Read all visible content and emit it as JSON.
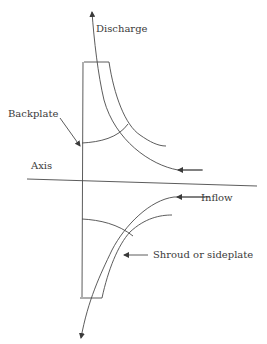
{
  "diagram": {
    "labels": {
      "discharge": "Discharge",
      "backplate": "Backplate",
      "axis": "Axis",
      "inflow": "Inflow",
      "shroud": "Shroud or sideplate"
    },
    "colors": {
      "line": "#4a4a4a",
      "text": "#3a3a3a",
      "background": "#ffffff"
    }
  }
}
